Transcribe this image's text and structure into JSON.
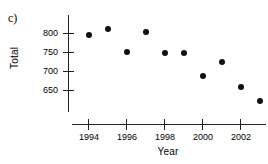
{
  "panel": {
    "label": "c)"
  },
  "chart_data": {
    "type": "scatter",
    "title": "",
    "xlabel": "Year",
    "ylabel": "Total",
    "x": [
      1994,
      1995,
      1996,
      1997,
      1998,
      1999,
      2000,
      2001,
      2002,
      2003
    ],
    "values": [
      795,
      812,
      752,
      803,
      750,
      748,
      688,
      725,
      660,
      623
    ],
    "series": [
      {
        "name": "Total",
        "x": [
          1994,
          1995,
          1996,
          1997,
          1998,
          1999,
          2000,
          2001,
          2002,
          2003
        ],
        "values": [
          795,
          812,
          752,
          803,
          750,
          748,
          688,
          725,
          660,
          623
        ]
      }
    ],
    "xlim": [
      1993.2,
      2003.6
    ],
    "ylim": [
      620,
      818
    ],
    "xticks": [
      1994,
      1996,
      1998,
      2000,
      2002
    ],
    "xticklabels": [
      "1994",
      "1996",
      "1998",
      "2000",
      "2002"
    ],
    "yticks": [
      650,
      700,
      750,
      800
    ],
    "yticklabels": [
      "650",
      "700",
      "750",
      "800"
    ],
    "grid": false,
    "legend": false,
    "marker": "filled-circle",
    "marker_color": "#101010"
  }
}
